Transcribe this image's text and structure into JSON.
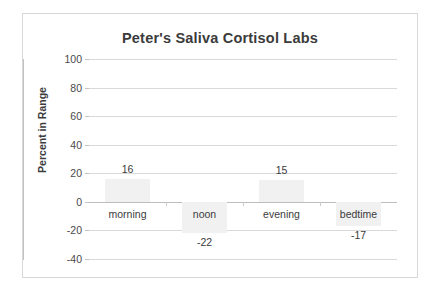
{
  "chart_data": {
    "type": "bar",
    "title": "Peter's Saliva Cortisol Labs",
    "xlabel": "",
    "ylabel": "Percent in Range",
    "categories": [
      "morning",
      "noon",
      "evening",
      "bedtime"
    ],
    "values": [
      16,
      -22,
      15,
      -17
    ],
    "data_labels": [
      "16",
      "-22",
      "15",
      "-17"
    ],
    "ylim": [
      -40,
      100
    ],
    "yticks": [
      100,
      80,
      60,
      40,
      20,
      0,
      -20,
      -40
    ],
    "ytick_labels": [
      "100",
      "80",
      "60",
      "40",
      "20",
      "0",
      "-20",
      "-40"
    ],
    "grid": true,
    "legend": false,
    "series": [
      {
        "name": "Percent in Range",
        "values": [
          16,
          -22,
          15,
          -17
        ],
        "color": "#f1f1f1"
      }
    ],
    "colors": {
      "bar_fill": "#f1f1f1",
      "gridline": "#d9d9d9",
      "axis_line": "#c2c2c2",
      "frame_border": "#d8d8d8",
      "text": "#3b3b3b",
      "background": "#ffffff"
    }
  }
}
